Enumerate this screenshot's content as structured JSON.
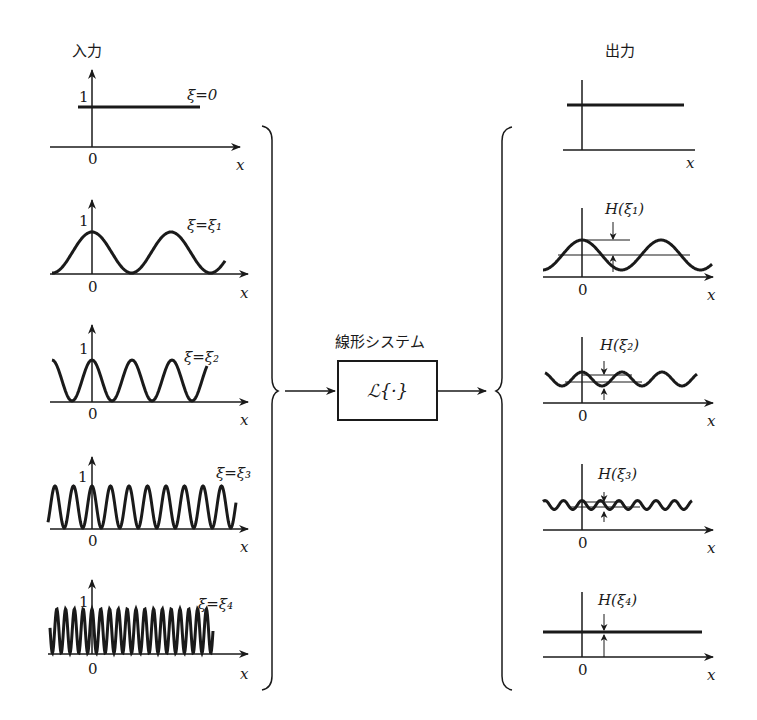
{
  "input": {
    "title": "入力",
    "panels": [
      {
        "xi_label": "ξ=0",
        "y_tick": "1",
        "origin": "0",
        "x_axis": "x"
      },
      {
        "xi_label": "ξ=ξ₁",
        "y_tick": "1",
        "origin": "0",
        "x_axis": "x"
      },
      {
        "xi_label": "ξ=ξ₂",
        "y_tick": "1",
        "origin": "0",
        "x_axis": "x"
      },
      {
        "xi_label": "ξ=ξ₃",
        "y_tick": "1",
        "origin": "0",
        "x_axis": "x"
      },
      {
        "xi_label": "ξ=ξ₄",
        "y_tick": "1",
        "origin": "0",
        "x_axis": "x"
      }
    ]
  },
  "system": {
    "title": "線形システム",
    "operator": "ℒ{·}"
  },
  "output": {
    "title": "出力",
    "panels": [
      {
        "h_label": "",
        "origin": "",
        "x_axis": "x"
      },
      {
        "h_label": "H(ξ₁)",
        "origin": "0",
        "x_axis": "x"
      },
      {
        "h_label": "H(ξ₂)",
        "origin": "0",
        "x_axis": "x"
      },
      {
        "h_label": "H(ξ₃)",
        "origin": "0",
        "x_axis": "x"
      },
      {
        "h_label": "H(ξ₄)",
        "origin": "0",
        "x_axis": "x"
      }
    ]
  },
  "colors": {
    "ink": "#1a1a1a",
    "background": "#ffffff"
  }
}
